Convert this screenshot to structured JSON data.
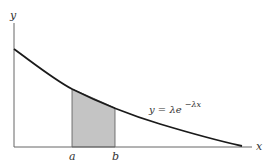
{
  "diagram": {
    "axes": {
      "x_label": "x",
      "y_label": "y"
    },
    "curve": {
      "label_prefix": "y = λe",
      "label_exponent": "−λx",
      "color": "#1a1a1a"
    },
    "region": {
      "left_label": "a",
      "right_label": "b",
      "fill": "#c4c4c4"
    },
    "colors": {
      "axis": "#555555",
      "background": "#ffffff"
    }
  }
}
